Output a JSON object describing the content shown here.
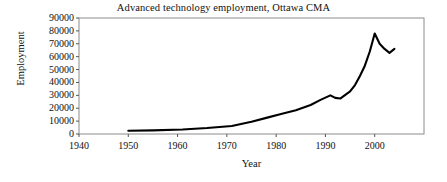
{
  "chart_data": {
    "type": "line",
    "title": "Advanced technology employment, Ottawa CMA",
    "xlabel": "Year",
    "ylabel": "Employment",
    "xlim": [
      1940,
      2010
    ],
    "ylim": [
      0,
      90000
    ],
    "xticks": [
      1940,
      1950,
      1960,
      1970,
      1980,
      1990,
      2000
    ],
    "xtick_labels": [
      "1940",
      "1950",
      "1960",
      "1970",
      "1980",
      "1990",
      "2000"
    ],
    "yticks": [
      0,
      10000,
      20000,
      30000,
      40000,
      50000,
      60000,
      70000,
      80000,
      90000
    ],
    "ytick_labels": [
      "0",
      "10000",
      "20000",
      "30000",
      "40000",
      "50000",
      "60000",
      "70000",
      "80000",
      "90000"
    ],
    "grid": false,
    "legend": false,
    "series": [
      {
        "name": "Advanced technology employment",
        "color": "#000000",
        "x": [
          1950,
          1955,
          1961,
          1966,
          1971,
          1975,
          1978,
          1981,
          1984,
          1987,
          1989,
          1991,
          1992,
          1993,
          1995,
          1996,
          1997,
          1998,
          1999,
          2000,
          2001,
          2002,
          2003,
          2004
        ],
        "values": [
          2500,
          2800,
          3500,
          4600,
          6200,
          9500,
          12500,
          15500,
          18500,
          22500,
          26500,
          30000,
          28000,
          27500,
          33000,
          38000,
          45000,
          53000,
          64000,
          78000,
          70000,
          66000,
          63000,
          66000
        ]
      }
    ]
  },
  "axes": {
    "plot_left_px": 79,
    "plot_right_px": 424,
    "plot_top_px": 18,
    "plot_bottom_px": 134
  }
}
